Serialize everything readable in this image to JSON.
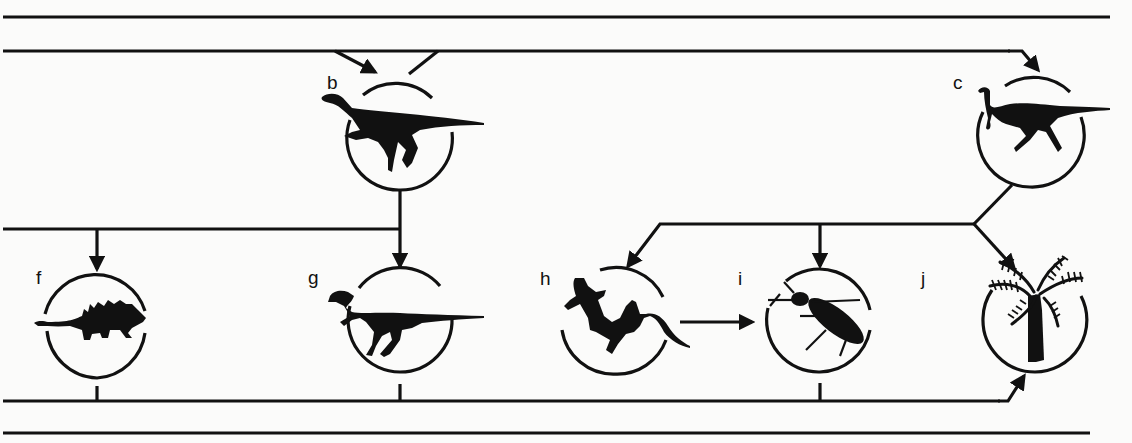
{
  "diagram": {
    "type": "food-web / ecological relationship flow",
    "nodes": [
      {
        "id": "b",
        "label": "b",
        "icon": "small-bipedal-dinosaur-silhouette",
        "cx": 400,
        "cy": 138
      },
      {
        "id": "c",
        "label": "c",
        "icon": "ornithomimid-dinosaur-silhouette",
        "cx": 1030,
        "cy": 135
      },
      {
        "id": "f",
        "label": "f",
        "icon": "ankylosaur-silhouette",
        "cx": 97,
        "cy": 322
      },
      {
        "id": "g",
        "label": "g",
        "icon": "theropod-dinosaur-silhouette",
        "cx": 400,
        "cy": 320
      },
      {
        "id": "h",
        "label": "h",
        "icon": "lizard-silhouette",
        "cx": 615,
        "cy": 322
      },
      {
        "id": "i",
        "label": "i",
        "icon": "beetle-silhouette",
        "cx": 820,
        "cy": 320
      },
      {
        "id": "j",
        "label": "j",
        "icon": "cycad-tree-silhouette",
        "cx": 1035,
        "cy": 320
      }
    ],
    "edges": [
      {
        "from": "upper-line",
        "to": "b",
        "arrow": true
      },
      {
        "from": "b",
        "to": "upper-line",
        "arrow": false
      },
      {
        "from": "upper-line",
        "to": "c",
        "arrow": true
      },
      {
        "from": "b",
        "to": "g",
        "arrow": true
      },
      {
        "from": "b-branch-line",
        "to": "f",
        "arrow": true
      },
      {
        "from": "c",
        "to": "h",
        "arrow": true
      },
      {
        "from": "c",
        "to": "i",
        "arrow": true
      },
      {
        "from": "c",
        "to": "j",
        "arrow": true
      },
      {
        "from": "h",
        "to": "i",
        "arrow": true
      },
      {
        "from": "f",
        "to": "lower-line",
        "arrow": false
      },
      {
        "from": "g",
        "to": "lower-line",
        "arrow": false
      },
      {
        "from": "i",
        "to": "lower-line",
        "arrow": false
      },
      {
        "from": "lower-line",
        "to": "j",
        "arrow": true
      }
    ],
    "colors": {
      "ink": "#111111",
      "background": "#fbfbfa"
    }
  }
}
